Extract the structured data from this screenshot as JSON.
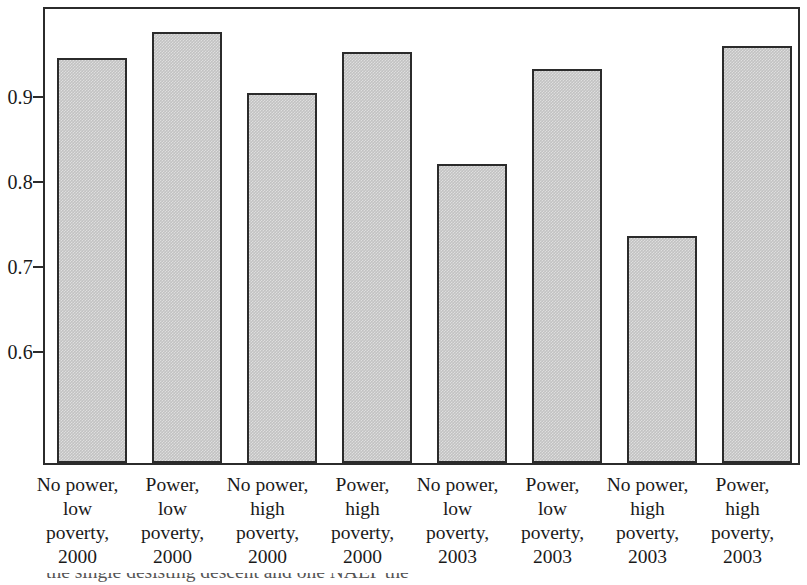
{
  "chart_data": {
    "type": "bar",
    "title": "",
    "xlabel": "",
    "ylabel": "",
    "grid": false,
    "legend": null,
    "ylim": [
      0.467,
      0.999
    ],
    "yticks": [
      0.6,
      0.7,
      0.8,
      0.9
    ],
    "ytick_labels": [
      "0.6",
      "0.7",
      "0.8",
      "0.9"
    ],
    "categories": [
      "No power, low poverty, 2000",
      "Power, low poverty, 2000",
      "No power, high poverty, 2000",
      "Power, high poverty, 2000",
      "No power, low poverty, 2003",
      "Power, low poverty, 2003",
      "No power, high poverty, 2003",
      "Power, high poverty, 2003"
    ],
    "category_lines": [
      [
        "No power,",
        "low",
        "poverty,",
        "2000"
      ],
      [
        "Power,",
        "low",
        "poverty,",
        "2000"
      ],
      [
        "No power,",
        "high",
        "poverty,",
        "2000"
      ],
      [
        "Power,",
        "high",
        "poverty,",
        "2000"
      ],
      [
        "No power,",
        "low",
        "poverty,",
        "2003"
      ],
      [
        "Power,",
        "low",
        "poverty,",
        "2003"
      ],
      [
        "No power,",
        "high",
        "poverty,",
        "2003"
      ],
      [
        "Power,",
        "high",
        "poverty,",
        "2003"
      ]
    ],
    "values": [
      0.941,
      0.972,
      0.901,
      0.949,
      0.817,
      0.929,
      0.733,
      0.956
    ],
    "bar_color": "#c2c2c2",
    "bar_edge_color": "#2b2b2b",
    "axis_color": "#2b2b2b",
    "background_color": "#ffffff"
  },
  "caption": {
    "partial_text": "the single desisting descent and one NAEP the"
  }
}
